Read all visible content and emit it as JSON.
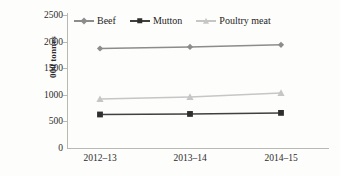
{
  "chart_data": {
    "type": "line",
    "title": "",
    "xlabel": "",
    "ylabel": "000 tonnes",
    "categories": [
      "2012–13",
      "2013–14",
      "2014–15"
    ],
    "ylim": [
      0,
      2500
    ],
    "yticks": [
      0,
      500,
      1000,
      1500,
      2000,
      2500
    ],
    "ytick_labels": [
      "0",
      "500",
      "1000",
      "1500",
      "2000",
      "2500"
    ],
    "grid": false,
    "legend_position": "top-center",
    "series": [
      {
        "name": "Beef",
        "values": [
          1870,
          1900,
          1940
        ],
        "color": "#8c8c8c",
        "marker": "diamond"
      },
      {
        "name": "Mutton",
        "values": [
          630,
          640,
          660
        ],
        "color": "#404040",
        "marker": "square"
      },
      {
        "name": "Poultry meat",
        "values": [
          920,
          960,
          1035
        ],
        "color": "#c6c6c6",
        "marker": "triangle"
      }
    ]
  },
  "legend": {
    "items": [
      {
        "label": "Beef"
      },
      {
        "label": "Mutton"
      },
      {
        "label": "Poultry meat"
      }
    ]
  },
  "axes": {
    "y_title": "000 tonnes",
    "y_labels": [
      "2500",
      "2000",
      "1500",
      "1000",
      "500",
      "0"
    ],
    "x_labels": [
      "2012–13",
      "2013–14",
      "2014–15"
    ]
  },
  "colors": {
    "background": "#fdfdfb",
    "axis": "#b9b9b4",
    "text": "#2b2b2b",
    "beef": "#8c8c8c",
    "mutton": "#404040",
    "poultry": "#c6c6c6"
  }
}
